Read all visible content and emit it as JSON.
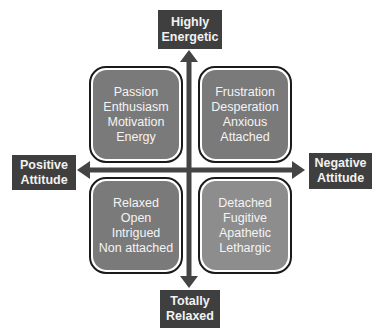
{
  "diagram": {
    "type": "quadrant",
    "axes": {
      "top": {
        "lines": [
          "Highly",
          "Energetic"
        ]
      },
      "bottom": {
        "lines": [
          "Totally",
          "Relaxed"
        ]
      },
      "left": {
        "lines": [
          "Positive",
          "Attitude"
        ]
      },
      "right": {
        "lines": [
          "Negative",
          "Attitude"
        ]
      }
    },
    "quadrants": {
      "top_left": {
        "items": [
          "Passion",
          "Enthusiasm",
          "Motivation",
          "Energy"
        ]
      },
      "top_right": {
        "items": [
          "Frustration",
          "Desperation",
          "Anxious",
          "Attached"
        ]
      },
      "bottom_left": {
        "items": [
          "Relaxed",
          "Open",
          "Intrigued",
          "Non attached"
        ]
      },
      "bottom_right": {
        "items": [
          "Detached",
          "Fugitive",
          "Apathetic",
          "Lethargic"
        ]
      }
    },
    "colors": {
      "label_box": "#3f3f3f",
      "label_text": "#f2f2f2",
      "quadrant_fill": "#7a7a7a",
      "quadrant_fill_light": "#8d8d8d",
      "axis": "#444444"
    }
  }
}
